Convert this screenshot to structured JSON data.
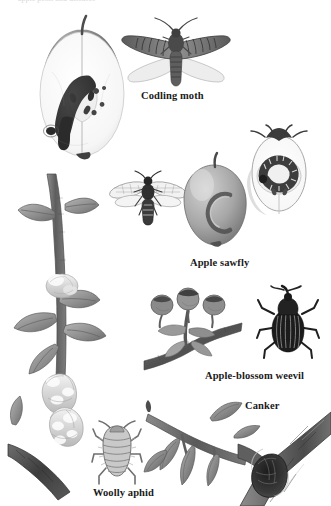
{
  "plate": {
    "medium": "grayscale engraving / watercolor plate",
    "background_color": "#ffffff",
    "ink_color": "#1a1a1a",
    "top_cutoff_text": "apple pests and diseases",
    "labels": [
      {
        "id": "codling-moth",
        "text": "Codling moth",
        "x": 141,
        "y": 90,
        "size": 10.5
      },
      {
        "id": "apple-sawfly",
        "text": "Apple sawfly",
        "x": 190,
        "y": 257,
        "size": 10.5
      },
      {
        "id": "apple-blossom-weevil",
        "text": "Apple-blossom weevil",
        "x": 205,
        "y": 370,
        "size": 10.5
      },
      {
        "id": "canker",
        "text": "Canker",
        "x": 245,
        "y": 400,
        "size": 10.5
      },
      {
        "id": "woolly-aphid",
        "text": "Woolly aphid",
        "x": 93,
        "y": 487,
        "size": 10.5
      }
    ],
    "figures": [
      {
        "id": "cut-apple-with-codling-larva",
        "caption_for": "Codling moth",
        "description": "Apple cut in half lengthwise showing pale flesh, core and a dark frass-filled tunnel with codling moth larva, plus an entry hole on the skin",
        "x": 18,
        "y": 14,
        "w": 128,
        "h": 152
      },
      {
        "id": "codling-moth-adult",
        "caption_for": "Codling moth",
        "description": "Adult codling moth, wings spread, dark striated forewings and pale hindwings, feathery antennae",
        "x": 118,
        "y": 16,
        "w": 116,
        "h": 76
      },
      {
        "id": "sawfly-adult",
        "caption_for": "Apple sawfly",
        "description": "Adult apple sawfly with transparent veined wings and banded abdomen",
        "x": 108,
        "y": 168,
        "w": 78,
        "h": 60
      },
      {
        "id": "apple-with-sawfly-scar",
        "caption_for": "Apple sawfly",
        "description": "Whole apple with curved ribbon-like surface scar caused by sawfly larva",
        "x": 172,
        "y": 155,
        "w": 82,
        "h": 95
      },
      {
        "id": "apple-section-with-sawfly-larva",
        "caption_for": "Apple sawfly",
        "description": "Apple cut across showing curled sawfly larva feeding in the core",
        "x": 232,
        "y": 124,
        "w": 92,
        "h": 104
      },
      {
        "id": "damaged-blossom-truss",
        "caption_for": "Apple-blossom weevil",
        "description": "Apple blossom truss on a twig with capped, browned unopened flowers damaged by weevil larvae",
        "x": 142,
        "y": 285,
        "w": 104,
        "h": 80
      },
      {
        "id": "apple-blossom-weevil-adult",
        "caption_for": "Apple-blossom weevil",
        "description": "Adult apple-blossom weevil, dark body, striated elytra, long curved snout and elbowed antennae",
        "x": 256,
        "y": 286,
        "w": 62,
        "h": 72
      },
      {
        "id": "apple-shoot-with-woolly-aphid",
        "caption_for": "Woolly aphid",
        "description": "Apple shoot with leaves and grey stem bearing lumpy white waxy woolly-aphid colonies",
        "x": 8,
        "y": 168,
        "w": 112,
        "h": 320
      },
      {
        "id": "woolly-aphid-enlarged",
        "caption_for": "Woolly aphid",
        "description": "Greatly enlarged woolly aphid, plump segmented body with legs and short antennae",
        "x": 92,
        "y": 420,
        "w": 48,
        "h": 66
      },
      {
        "id": "wilted-shoot-canker",
        "caption_for": "Canker",
        "description": "Apple shoot with drooping wilted brown leaves, symptom of canker infection",
        "x": 142,
        "y": 398,
        "w": 110,
        "h": 100
      },
      {
        "id": "cankered-branch",
        "caption_for": "Canker",
        "description": "Branch crotch with a rough, sunken dark canker lesion in the bark",
        "x": 238,
        "y": 412,
        "w": 93,
        "h": 94
      }
    ]
  }
}
